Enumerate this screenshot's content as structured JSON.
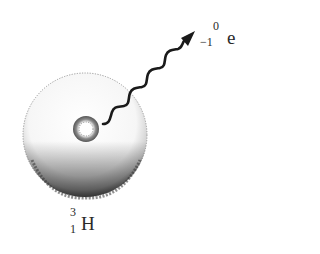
{
  "diagram": {
    "atom": {
      "element_symbol": "H",
      "mass_number": "3",
      "atomic_number": "1"
    },
    "emitted_particle": {
      "symbol": "e",
      "mass_number": "0",
      "charge_number": "−1"
    },
    "icons": {
      "atom": "electron-cloud-sphere",
      "nucleus": "nucleus-circle",
      "emission": "wavy-arrow"
    },
    "colors": {
      "ink": "#222222",
      "cloud_shading": "#555555",
      "background": "#ffffff"
    }
  }
}
